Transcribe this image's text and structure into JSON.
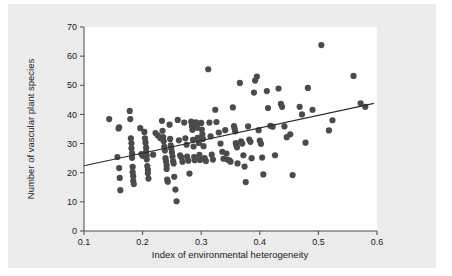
{
  "figure": {
    "background_color": "#ececec",
    "page_color": "#ffffff",
    "plot_area_color": "#ffffff",
    "marker_color": "#4b4b4b",
    "line_color": "#2b2b2b",
    "axis_color": "#4a4a4a"
  },
  "chart_data": {
    "type": "scatter",
    "title": "",
    "xlabel": "Index of environmental heterogeneity",
    "ylabel": "Number of vascular plant species",
    "xlim": [
      0.1,
      0.6
    ],
    "ylim": [
      0,
      70
    ],
    "xticks": [
      0.1,
      0.2,
      0.3,
      0.4,
      0.5,
      0.6
    ],
    "xticklabels": [
      "0.1",
      "0.2",
      "0.3",
      "0.4",
      "0.5",
      "0.6"
    ],
    "yticks": [
      0,
      10,
      20,
      30,
      40,
      50,
      60,
      70
    ],
    "yticklabels": [
      "0",
      "10",
      "20",
      "30",
      "40",
      "50",
      "60",
      "70"
    ],
    "grid": false,
    "legend": null,
    "marker": "filled-circle",
    "marker_size": 3.1,
    "n_points": 152,
    "trendline": {
      "type": "linear-fit",
      "x_start": 0.1,
      "y_start": 22.4,
      "x_end": 0.595,
      "y_end": 43.8,
      "slope": 43.2,
      "intercept": 18.1
    },
    "points": [
      [
        0.143,
        38.4
      ],
      [
        0.157,
        25.4
      ],
      [
        0.159,
        35.2
      ],
      [
        0.16,
        35.6
      ],
      [
        0.16,
        21.6
      ],
      [
        0.161,
        18.2
      ],
      [
        0.162,
        14.0
      ],
      [
        0.178,
        41.2
      ],
      [
        0.179,
        38.4
      ],
      [
        0.18,
        31.8
      ],
      [
        0.181,
        30.1
      ],
      [
        0.181,
        28.4
      ],
      [
        0.182,
        26.7
      ],
      [
        0.182,
        25.1
      ],
      [
        0.183,
        22.0
      ],
      [
        0.183,
        20.2
      ],
      [
        0.184,
        18.8
      ],
      [
        0.184,
        17.2
      ],
      [
        0.185,
        16.1
      ],
      [
        0.196,
        35.3
      ],
      [
        0.198,
        26.4
      ],
      [
        0.2,
        25.8
      ],
      [
        0.203,
        34.0
      ],
      [
        0.204,
        31.8
      ],
      [
        0.205,
        30.3
      ],
      [
        0.206,
        28.6
      ],
      [
        0.206,
        27.2
      ],
      [
        0.207,
        25.9
      ],
      [
        0.207,
        24.6
      ],
      [
        0.208,
        22.3
      ],
      [
        0.209,
        21.0
      ],
      [
        0.209,
        19.8
      ],
      [
        0.21,
        18.0
      ],
      [
        0.218,
        26.2
      ],
      [
        0.222,
        33.6
      ],
      [
        0.226,
        32.8
      ],
      [
        0.23,
        31.9
      ],
      [
        0.233,
        37.8
      ],
      [
        0.234,
        34.4
      ],
      [
        0.235,
        32.2
      ],
      [
        0.236,
        30.8
      ],
      [
        0.237,
        28.9
      ],
      [
        0.238,
        27.6
      ],
      [
        0.239,
        25.0
      ],
      [
        0.24,
        23.9
      ],
      [
        0.241,
        22.6
      ],
      [
        0.241,
        21.3
      ],
      [
        0.242,
        17.6
      ],
      [
        0.243,
        16.9
      ],
      [
        0.246,
        36.5
      ],
      [
        0.247,
        31.6
      ],
      [
        0.248,
        29.4
      ],
      [
        0.249,
        28.2
      ],
      [
        0.25,
        27.0
      ],
      [
        0.251,
        25.6
      ],
      [
        0.252,
        24.0
      ],
      [
        0.253,
        23.2
      ],
      [
        0.254,
        18.6
      ],
      [
        0.256,
        14.2
      ],
      [
        0.258,
        10.2
      ],
      [
        0.26,
        38.1
      ],
      [
        0.262,
        31.1
      ],
      [
        0.264,
        26.0
      ],
      [
        0.266,
        25.3
      ],
      [
        0.268,
        23.8
      ],
      [
        0.271,
        37.2
      ],
      [
        0.273,
        31.8
      ],
      [
        0.275,
        29.6
      ],
      [
        0.276,
        25.5
      ],
      [
        0.278,
        24.1
      ],
      [
        0.28,
        19.7
      ],
      [
        0.283,
        37.5
      ],
      [
        0.284,
        36.0
      ],
      [
        0.285,
        34.7
      ],
      [
        0.286,
        31.3
      ],
      [
        0.287,
        29.0
      ],
      [
        0.288,
        25.4
      ],
      [
        0.289,
        24.3
      ],
      [
        0.291,
        37.3
      ],
      [
        0.292,
        36.6
      ],
      [
        0.293,
        35.4
      ],
      [
        0.294,
        32.0
      ],
      [
        0.295,
        31.5
      ],
      [
        0.296,
        30.2
      ],
      [
        0.297,
        26.1
      ],
      [
        0.298,
        24.4
      ],
      [
        0.3,
        37.1
      ],
      [
        0.301,
        34.8
      ],
      [
        0.302,
        33.2
      ],
      [
        0.303,
        31.6
      ],
      [
        0.304,
        29.1
      ],
      [
        0.306,
        25.0
      ],
      [
        0.308,
        24.0
      ],
      [
        0.312,
        55.5
      ],
      [
        0.314,
        37.2
      ],
      [
        0.316,
        32.5
      ],
      [
        0.318,
        26.2
      ],
      [
        0.32,
        24.5
      ],
      [
        0.324,
        41.6
      ],
      [
        0.326,
        37.4
      ],
      [
        0.33,
        33.8
      ],
      [
        0.333,
        30.0
      ],
      [
        0.336,
        27.2
      ],
      [
        0.338,
        24.8
      ],
      [
        0.341,
        34.6
      ],
      [
        0.343,
        26.6
      ],
      [
        0.345,
        24.5
      ],
      [
        0.348,
        24.2
      ],
      [
        0.35,
        23.8
      ],
      [
        0.354,
        42.4
      ],
      [
        0.356,
        36.0
      ],
      [
        0.357,
        35.1
      ],
      [
        0.358,
        34.2
      ],
      [
        0.359,
        30.2
      ],
      [
        0.36,
        29.5
      ],
      [
        0.361,
        28.7
      ],
      [
        0.362,
        23.2
      ],
      [
        0.366,
        50.8
      ],
      [
        0.368,
        30.8
      ],
      [
        0.37,
        30.0
      ],
      [
        0.372,
        26.0
      ],
      [
        0.374,
        22.1
      ],
      [
        0.376,
        16.8
      ],
      [
        0.38,
        35.9
      ],
      [
        0.382,
        31.4
      ],
      [
        0.384,
        30.6
      ],
      [
        0.386,
        25.0
      ],
      [
        0.39,
        47.5
      ],
      [
        0.392,
        51.6
      ],
      [
        0.395,
        53.0
      ],
      [
        0.398,
        34.6
      ],
      [
        0.4,
        31.0
      ],
      [
        0.402,
        29.9
      ],
      [
        0.404,
        25.2
      ],
      [
        0.406,
        19.4
      ],
      [
        0.412,
        48.0
      ],
      [
        0.414,
        42.2
      ],
      [
        0.418,
        36.1
      ],
      [
        0.422,
        35.8
      ],
      [
        0.426,
        26.0
      ],
      [
        0.432,
        48.9
      ],
      [
        0.436,
        43.6
      ],
      [
        0.438,
        42.6
      ],
      [
        0.442,
        35.9
      ],
      [
        0.446,
        32.2
      ],
      [
        0.452,
        33.2
      ],
      [
        0.456,
        19.2
      ],
      [
        0.468,
        42.6
      ],
      [
        0.472,
        40.0
      ],
      [
        0.478,
        30.3
      ],
      [
        0.482,
        49.1
      ],
      [
        0.49,
        41.6
      ],
      [
        0.505,
        63.8
      ],
      [
        0.518,
        34.5
      ],
      [
        0.524,
        38.0
      ],
      [
        0.56,
        53.2
      ],
      [
        0.572,
        43.8
      ],
      [
        0.58,
        42.6
      ]
    ]
  }
}
